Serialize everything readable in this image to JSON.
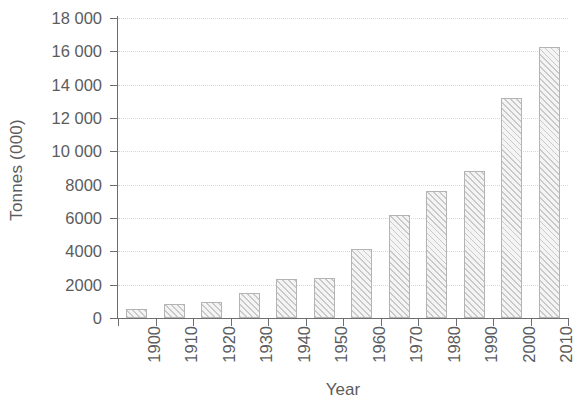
{
  "chart_data": {
    "type": "bar",
    "title": "",
    "subtitle": "",
    "xlabel": "Year",
    "ylabel": "Tonnes (000)",
    "categories": [
      "1900",
      "1910",
      "1920",
      "1930",
      "1940",
      "1950",
      "1960",
      "1970",
      "1980",
      "1990",
      "2000",
      "2010"
    ],
    "values": [
      540,
      840,
      950,
      1500,
      2350,
      2430,
      4150,
      6200,
      7600,
      8800,
      13200,
      16250
    ],
    "series": [
      {
        "name": "Tonnes (000)",
        "values": [
          540,
          840,
          950,
          1500,
          2350,
          2430,
          4150,
          6200,
          7600,
          8800,
          13200,
          16250
        ]
      }
    ],
    "ylim": [
      0,
      18000
    ],
    "ytick_values": [
      0,
      2000,
      4000,
      6000,
      8000,
      10000,
      12000,
      14000,
      16000,
      18000
    ],
    "ytick_labels": [
      "0",
      "2000",
      "4000",
      "6000",
      "8000",
      "10 000",
      "12 000",
      "14 000",
      "16 000",
      "18 000"
    ],
    "grid": "horizontal-dotted",
    "legend": "none",
    "bar_fill": "#f2f2f2",
    "bar_hatch": "diagonal",
    "bar_edge_color": "#b4b4b4",
    "axis_color": "#6d6e71",
    "grid_color": "#d6d6d6",
    "text_color": "#5b5c5e",
    "xtick_label_rotation": -90
  }
}
